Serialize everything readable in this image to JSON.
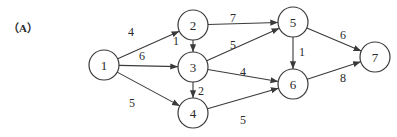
{
  "figure": {
    "label": "（A）",
    "colors": {
      "stroke": "#3a3a3a",
      "text": "#2a2a2a",
      "background": "#ffffff"
    }
  },
  "graph": {
    "directed": true,
    "nodes": [
      {
        "id": "1",
        "label": "1",
        "x": 104,
        "y": 65
      },
      {
        "id": "2",
        "label": "2",
        "x": 193,
        "y": 25
      },
      {
        "id": "3",
        "label": "3",
        "x": 193,
        "y": 67
      },
      {
        "id": "4",
        "label": "4",
        "x": 193,
        "y": 113
      },
      {
        "id": "5",
        "label": "5",
        "x": 293,
        "y": 22
      },
      {
        "id": "6",
        "label": "6",
        "x": 293,
        "y": 84
      },
      {
        "id": "7",
        "label": "7",
        "x": 375,
        "y": 57
      }
    ],
    "edges": [
      {
        "from": "1",
        "to": "2",
        "weight": "4",
        "lx": 131,
        "ly": 36
      },
      {
        "from": "1",
        "to": "3",
        "weight": "6",
        "lx": 142,
        "ly": 60
      },
      {
        "from": "1",
        "to": "4",
        "weight": "5",
        "lx": 132,
        "ly": 107
      },
      {
        "from": "2",
        "to": "3",
        "weight": "1",
        "lx": 176,
        "ly": 45
      },
      {
        "from": "2",
        "to": "5",
        "weight": "7",
        "lx": 233,
        "ly": 22
      },
      {
        "from": "3",
        "to": "5",
        "weight": "5",
        "lx": 233,
        "ly": 49
      },
      {
        "from": "3",
        "to": "4",
        "weight": "2",
        "lx": 201,
        "ly": 95
      },
      {
        "from": "3",
        "to": "6",
        "weight": "4",
        "lx": 243,
        "ly": 76
      },
      {
        "from": "4",
        "to": "6",
        "weight": "5",
        "lx": 243,
        "ly": 124
      },
      {
        "from": "5",
        "to": "6",
        "weight": "1",
        "lx": 302,
        "ly": 56
      },
      {
        "from": "5",
        "to": "7",
        "weight": "6",
        "lx": 343,
        "ly": 39
      },
      {
        "from": "6",
        "to": "7",
        "weight": "8",
        "lx": 343,
        "ly": 82
      }
    ]
  }
}
